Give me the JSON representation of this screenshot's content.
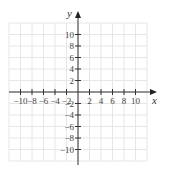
{
  "chart_data": {
    "type": "scatter",
    "title": "",
    "xlabel": "x",
    "ylabel": "y",
    "xlim": [
      -12,
      12
    ],
    "ylim": [
      -12,
      12
    ],
    "grid": true,
    "x_ticks": [
      -10,
      -8,
      -6,
      -4,
      -2,
      2,
      4,
      6,
      8,
      10
    ],
    "y_ticks": [
      10,
      8,
      6,
      4,
      2,
      -2,
      -4,
      -6,
      -8,
      -10
    ],
    "x_tick_labels": [
      "−10",
      "−8",
      "−6",
      "−4",
      "−2",
      "2",
      "4",
      "6",
      "8",
      "10"
    ],
    "y_tick_labels": [
      "10",
      "8",
      "6",
      "4",
      "2",
      "−2",
      "−4",
      "−6",
      "−8",
      "−10"
    ],
    "series": [],
    "legend": null
  },
  "colors": {
    "grid": "#e6e6e6",
    "axis": "#333333",
    "text": "#444444"
  }
}
